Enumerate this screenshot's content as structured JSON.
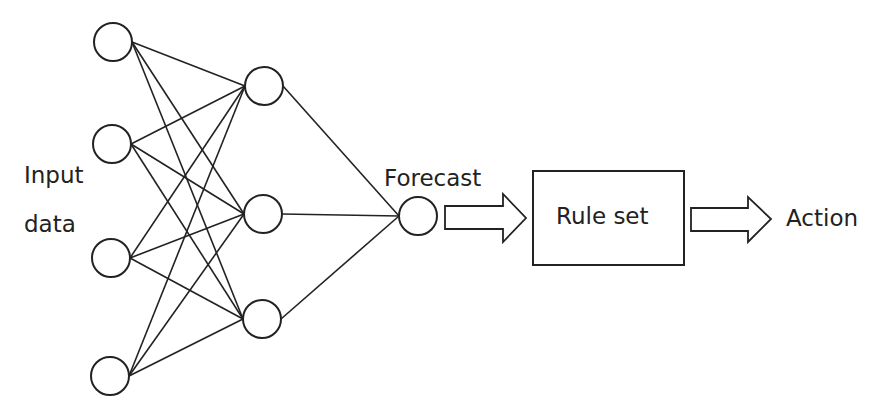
{
  "diagram": {
    "input_label_line1": "Input",
    "input_label_line2": "data",
    "forecast_label": "Forecast",
    "rule_set_label": "Rule set",
    "action_label": "Action",
    "layers": {
      "input_nodes": 4,
      "hidden_nodes": 3,
      "output_nodes": 1
    },
    "flow": [
      "Input data",
      "Neural network",
      "Forecast",
      "Rule set",
      "Action"
    ],
    "colors": {
      "stroke": "#222222",
      "background": "#ffffff"
    }
  }
}
